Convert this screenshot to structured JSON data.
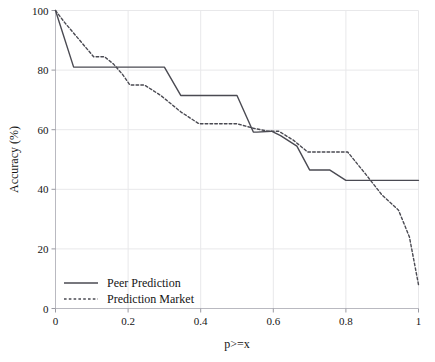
{
  "chart_data": {
    "type": "line",
    "title": "",
    "subtitle": "",
    "xlabel": "p>=x",
    "ylabel": "Accuracy (%)",
    "xlim": [
      0,
      1
    ],
    "ylim": [
      0,
      100
    ],
    "xticks": [
      0,
      0.2,
      0.4,
      0.6,
      0.8,
      1
    ],
    "xtick_labels": [
      "0",
      "0.2",
      "0.4",
      "0.6",
      "0.8",
      "1"
    ],
    "yticks": [
      0,
      20,
      40,
      60,
      80,
      100
    ],
    "ytick_labels": [
      "0",
      "20",
      "40",
      "60",
      "80",
      "100"
    ],
    "grid": true,
    "grid_color": "#e8e8ea",
    "legend_position": "lower-left",
    "series": [
      {
        "name": "Peer Prediction",
        "style": "solid",
        "color": "#4a4a52",
        "x": [
          0.0,
          0.05,
          0.3,
          0.345,
          0.5,
          0.545,
          0.555,
          0.595,
          0.62,
          0.665,
          0.7,
          0.755,
          0.8,
          1.0
        ],
        "y": [
          100.0,
          81.0,
          81.0,
          71.5,
          71.5,
          59.2,
          59.2,
          59.5,
          58.0,
          54.5,
          46.5,
          46.5,
          43.0,
          43.0
        ]
      },
      {
        "name": "Prediction Market",
        "style": "dotted",
        "color": "#4a4a52",
        "x": [
          0.0,
          0.025,
          0.105,
          0.135,
          0.16,
          0.185,
          0.205,
          0.245,
          0.29,
          0.345,
          0.395,
          0.5,
          0.545,
          0.585,
          0.615,
          0.655,
          0.695,
          0.745,
          0.805,
          0.855,
          0.9,
          0.945,
          0.975,
          1.0
        ],
        "y": [
          100.0,
          96.0,
          84.5,
          84.5,
          82.0,
          78.5,
          75.0,
          75.0,
          71.5,
          66.0,
          62.0,
          62.0,
          60.5,
          59.5,
          59.5,
          56.5,
          52.5,
          52.5,
          52.5,
          45.0,
          38.0,
          33.0,
          24.0,
          8.0
        ]
      }
    ]
  },
  "legend": {
    "items": [
      {
        "label": "Peer Prediction",
        "style": "solid"
      },
      {
        "label": "Prediction Market",
        "style": "dotted"
      }
    ]
  }
}
